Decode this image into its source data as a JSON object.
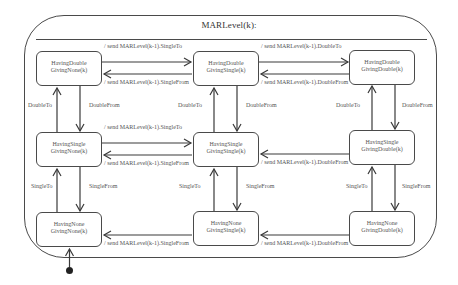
{
  "diagram": {
    "title": "MARLevel(k):",
    "states": {
      "hd_gn": {
        "line1": "HavingDouble",
        "line2": "GivingNone(k)"
      },
      "hd_gs": {
        "line1": "HavingDouble",
        "line2": "GivingSingle(k)"
      },
      "hd_gd": {
        "line1": "HavingDouble",
        "line2": "GivingDouble(k)"
      },
      "hs_gn": {
        "line1": "HavingSingle",
        "line2": "GivingNone(k)"
      },
      "hs_gs": {
        "line1": "HavingSingle",
        "line2": "GivingSingle(k)"
      },
      "hs_gd": {
        "line1": "HavingSingle",
        "line2": "GivingDouble(k)"
      },
      "hn_gn": {
        "line1": "HavingNone",
        "line2": "GivingNone(k)"
      },
      "hn_gs": {
        "line1": "HavingNone",
        "line2": "GivingSingle(k)"
      },
      "hn_gd": {
        "line1": "HavingNone",
        "line2": "GivingDouble(k)"
      }
    },
    "transitions": {
      "top_left_to_center": "/ send MARLevel(k-1).SingleTo",
      "top_center_to_left": "/ send MARLevel(k-1).SingleFrom",
      "top_center_to_right": "/ send MARLevel(k-1).DoubleTo",
      "top_right_to_center": "/ send MARLevel(k-1).DoubleFrom",
      "mid_left_to_center": "/ send MARLevel(k-1).SingleTo",
      "mid_center_to_left": "/ send MARLevel(k-1).SingleFrom",
      "mid_right_to_center": "/ send MARLevel(k-1).DoubleFrom",
      "bot_center_to_left": "/ send MARLevel(k-1).SingleFrom",
      "bot_right_to_center": "/ send MARLevel(k-1).DoubleFrom",
      "double_to": "DoubleTo",
      "double_from": "DoubleFrom",
      "single_to": "SingleTo",
      "single_from": "SingleFrom"
    },
    "initial_state": "HavingNone GivingNone(k)"
  }
}
